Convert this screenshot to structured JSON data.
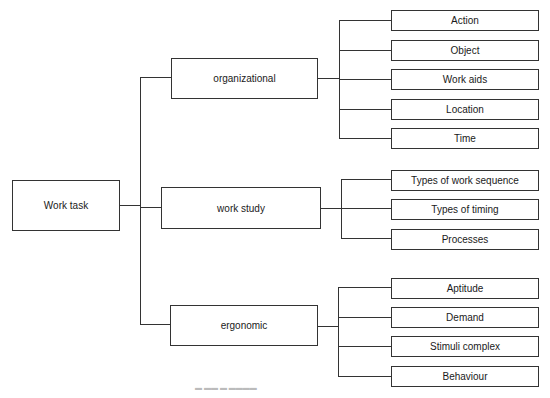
{
  "diagram": {
    "type": "tree",
    "root": {
      "label": "Work task",
      "children": [
        {
          "label": "organizational",
          "children": [
            {
              "label": "Action"
            },
            {
              "label": "Object"
            },
            {
              "label": "Work aids"
            },
            {
              "label": "Location"
            },
            {
              "label": "Time"
            }
          ]
        },
        {
          "label": "work study",
          "children": [
            {
              "label": "Types of work sequence"
            },
            {
              "label": "Types of timing"
            },
            {
              "label": "Processes"
            }
          ]
        },
        {
          "label": "ergonomic",
          "children": [
            {
              "label": "Aptitude"
            },
            {
              "label": "Demand"
            },
            {
              "label": "Stimuli complex"
            },
            {
              "label": "Behaviour"
            }
          ]
        }
      ]
    },
    "colors": {
      "line": "#333333",
      "box_border": "#333333",
      "background": "#ffffff"
    }
  }
}
